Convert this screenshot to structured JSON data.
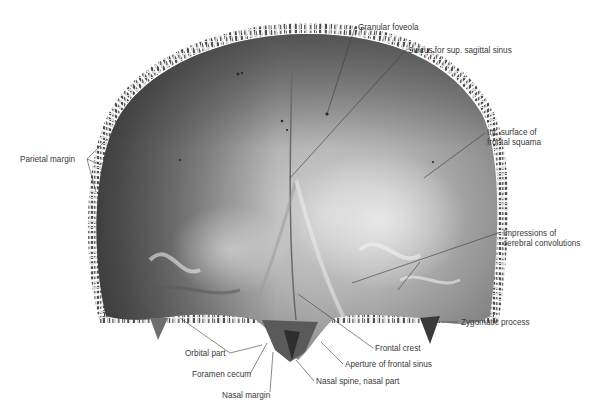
{
  "figure": {
    "colors": {
      "background": "#ffffff",
      "bone_dark": "#4a4a4a",
      "bone_mid": "#8a8a8a",
      "bone_light": "#d6d6d6",
      "margin": "#5c5c5c",
      "leader_line": "#3a3a3a",
      "label_text": "#3a3a3a"
    },
    "labels": [
      {
        "id": "granular-foveola",
        "text": "Granular foveola",
        "x": 358,
        "y": 23,
        "anchor": [
          327,
          114
        ]
      },
      {
        "id": "sulcus-sup-sagittal-sinus",
        "text": "Sulcus for sup. sagittal sinus",
        "x": 408,
        "y": 46,
        "anchor": [
          290,
          178
        ]
      },
      {
        "id": "int-surface-frontal-squama",
        "lines": [
          "Int. surface of",
          "frontal squama"
        ],
        "x": 487,
        "y": 128,
        "anchor": [
          424,
          178
        ]
      },
      {
        "id": "impressions-cerebral-convolutions",
        "lines": [
          "Impressions of",
          "cerebral convolutions"
        ],
        "x": 503,
        "y": 229,
        "anchor": [
          352,
          283
        ]
      },
      {
        "id": "parietal-margin",
        "text": "Parietal margin",
        "x": 20,
        "y": 155,
        "anchors": [
          [
            106,
            140
          ],
          [
            101,
            165
          ],
          [
            96,
            192
          ]
        ]
      },
      {
        "id": "zygomatic-process",
        "text": "Zygomatic process",
        "x": 461,
        "y": 319,
        "anchor": [
          430,
          322
        ]
      },
      {
        "id": "frontal-crest",
        "text": "Frontal crest",
        "x": 375,
        "y": 345,
        "anchor": [
          298,
          294
        ]
      },
      {
        "id": "aperture-frontal-sinus",
        "text": "Aperture of frontal sinus",
        "x": 345,
        "y": 361,
        "anchor": [
          321,
          342
        ]
      },
      {
        "id": "nasal-spine-nasal-part",
        "text": "Nasal spine, nasal part",
        "x": 316,
        "y": 378,
        "anchor": [
          296,
          360
        ]
      },
      {
        "id": "orbital-part",
        "text": "Orbital part",
        "x": 185,
        "y": 350,
        "anchor": [
          180,
          318
        ]
      },
      {
        "id": "foramen-cecum",
        "text": "Foramen cecum",
        "x": 192,
        "y": 371,
        "anchor": [
          267,
          343
        ]
      },
      {
        "id": "nasal-margin",
        "text": "Nasal margin",
        "x": 222,
        "y": 392,
        "anchor": [
          273,
          352
        ]
      }
    ]
  }
}
